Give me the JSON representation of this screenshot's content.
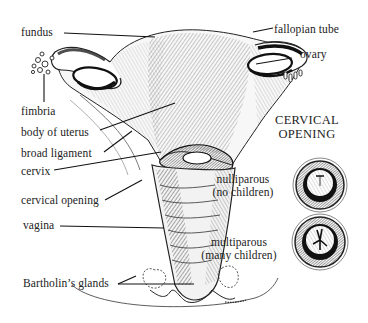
{
  "diagram": {
    "labels": {
      "fundus": "fundus",
      "fallopian_tube": "fallopian tube",
      "ovary": "ovary",
      "fimbria": "fimbria",
      "body_of_uterus": "body of uterus",
      "broad_ligament": "broad ligament",
      "cervix": "cervix",
      "cervical_opening": "cervical opening",
      "vagina": "vagina",
      "bartholins_glands": "Bartholin’s glands"
    },
    "inset": {
      "title_line1": "CERVICAL",
      "title_line2": "OPENING",
      "nulliparous": {
        "line1": "nulliparous",
        "line2": "(no children)"
      },
      "multiparous": {
        "line1": "multiparous",
        "line2": "(many children)"
      }
    }
  }
}
